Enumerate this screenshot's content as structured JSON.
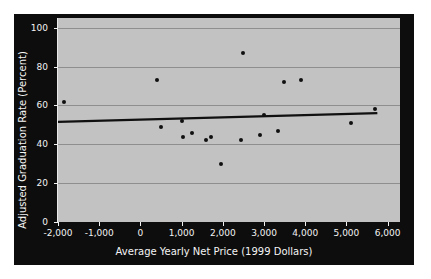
{
  "chart_data": {
    "type": "scatter",
    "title": "",
    "xlabel": "Average Yearly Net Price (1999 Dollars)",
    "ylabel": "Adjusted Graduation Rate (Percent)",
    "xlim": [
      -2000,
      6300
    ],
    "ylim": [
      0,
      105
    ],
    "xticks": [
      -2000,
      -1000,
      0,
      1000,
      2000,
      3000,
      4000,
      5000,
      6000
    ],
    "xticklabels": [
      "-2,000",
      "-1,000",
      "0",
      "1,000",
      "2,000",
      "3,000",
      "4,000",
      "5,000",
      "6,000"
    ],
    "yticks": [
      0,
      20,
      40,
      60,
      80,
      100
    ],
    "yticklabels": [
      "0",
      "20",
      "40",
      "60",
      "80",
      "100"
    ],
    "grid": "horizontal",
    "legend": "none",
    "points": [
      {
        "x": -1850,
        "y": 62
      },
      {
        "x": 400,
        "y": 73
      },
      {
        "x": 500,
        "y": 49
      },
      {
        "x": 1000,
        "y": 52
      },
      {
        "x": 1030,
        "y": 44
      },
      {
        "x": 1250,
        "y": 46
      },
      {
        "x": 1580,
        "y": 42
      },
      {
        "x": 1720,
        "y": 44
      },
      {
        "x": 1950,
        "y": 30
      },
      {
        "x": 2430,
        "y": 42
      },
      {
        "x": 2500,
        "y": 87
      },
      {
        "x": 2900,
        "y": 45
      },
      {
        "x": 3000,
        "y": 55
      },
      {
        "x": 3350,
        "y": 47
      },
      {
        "x": 3480,
        "y": 72
      },
      {
        "x": 3900,
        "y": 73
      },
      {
        "x": 5120,
        "y": 51
      },
      {
        "x": 5700,
        "y": 58
      }
    ],
    "trendline": {
      "x0": -2000,
      "y0": 51.5,
      "x1": 5750,
      "y1": 56.0,
      "color": "#101010"
    },
    "colors": {
      "plot_background": "#c2c2c2",
      "panel_background": "#0d0d0d",
      "gridline": "#8e8e8e",
      "marker": "#101010",
      "axis_text": "#f2f2f2"
    }
  }
}
